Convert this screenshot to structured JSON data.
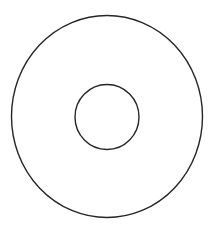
{
  "diagram": {
    "background": "#ffffff",
    "stroke_color": "#262626",
    "stroke_width": 1.4,
    "shapes": [
      {
        "name": "outer-circle",
        "type": "ellipse",
        "cx": 107,
        "cy": 116.5,
        "rx": 95.5,
        "ry": 101
      },
      {
        "name": "inner-circle",
        "type": "ellipse",
        "cx": 107,
        "cy": 117,
        "rx": 32,
        "ry": 32.5
      }
    ]
  }
}
